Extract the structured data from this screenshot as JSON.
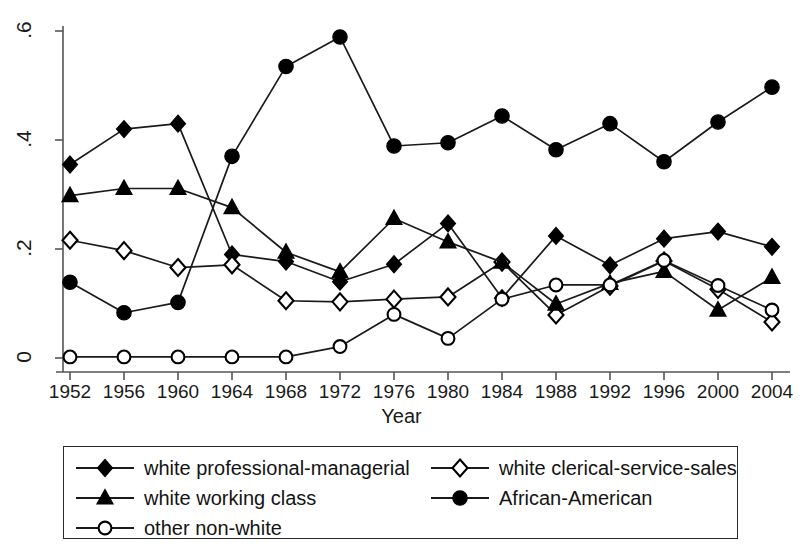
{
  "chart_data": {
    "type": "line",
    "title": "",
    "subtitle": "",
    "xlabel": "Year",
    "ylabel": "",
    "x": [
      1952,
      1956,
      1960,
      1964,
      1968,
      1972,
      1976,
      1980,
      1984,
      1988,
      1992,
      1996,
      2000,
      2004
    ],
    "categories": [
      "1952",
      "1956",
      "1960",
      "1964",
      "1968",
      "1972",
      "1976",
      "1980",
      "1984",
      "1988",
      "1992",
      "1996",
      "2000",
      "2004"
    ],
    "xlim": [
      1952,
      2004
    ],
    "ylim": [
      0,
      0.6
    ],
    "yticks": [
      0,
      0.2,
      0.4,
      0.6
    ],
    "ytick_labels": [
      "0",
      ".2",
      ".4",
      ".6"
    ],
    "xticks": [
      1952,
      1956,
      1960,
      1964,
      1968,
      1972,
      1976,
      1980,
      1984,
      1988,
      1992,
      1996,
      2000,
      2004
    ],
    "grid": false,
    "legend_position": "below-plot",
    "series": [
      {
        "name": "white professional-managerial",
        "marker": "filled-diamond",
        "color": "#000000",
        "values": [
          0.355,
          0.42,
          0.43,
          0.19,
          0.177,
          0.14,
          0.172,
          0.247,
          0.11,
          0.224,
          0.17,
          0.219,
          0.232,
          0.204
        ]
      },
      {
        "name": "white clerical-service-sales",
        "marker": "open-diamond",
        "color": "#000000",
        "values": [
          0.216,
          0.197,
          0.166,
          0.171,
          0.105,
          0.103,
          0.108,
          0.112,
          0.176,
          0.079,
          0.132,
          0.178,
          0.126,
          0.066
        ]
      },
      {
        "name": "white working class",
        "marker": "filled-triangle",
        "color": "#000000",
        "values": [
          0.298,
          0.311,
          0.311,
          0.276,
          0.194,
          0.158,
          0.256,
          0.213,
          0.176,
          0.099,
          0.137,
          0.159,
          0.088,
          0.148
        ]
      },
      {
        "name": "African-American",
        "marker": "filled-circle",
        "color": "#000000",
        "values": [
          0.139,
          0.083,
          0.102,
          0.37,
          0.535,
          0.589,
          0.389,
          0.395,
          0.444,
          0.382,
          0.43,
          0.36,
          0.433,
          0.497
        ]
      },
      {
        "name": "other non-white",
        "marker": "open-circle",
        "color": "#000000",
        "values": [
          0.002,
          0.002,
          0.002,
          0.002,
          0.002,
          0.021,
          0.08,
          0.036,
          0.108,
          0.134,
          0.134,
          0.179,
          0.133,
          0.088
        ]
      }
    ]
  },
  "legend": {
    "entries": [
      {
        "label": "white professional-managerial",
        "marker": "filled-diamond"
      },
      {
        "label": "white clerical-service-sales",
        "marker": "open-diamond"
      },
      {
        "label": "white working class",
        "marker": "filled-triangle"
      },
      {
        "label": "African-American",
        "marker": "filled-circle"
      },
      {
        "label": "other non-white",
        "marker": "open-circle"
      }
    ]
  },
  "style": {
    "line_color": "#1a1a1a",
    "axis_color": "#555555",
    "background": "#ffffff"
  }
}
